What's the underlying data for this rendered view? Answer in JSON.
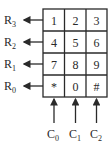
{
  "diagram": {
    "type": "keypad-matrix",
    "grid": {
      "rows": [
        [
          "1",
          "2",
          "3"
        ],
        [
          "4",
          "5",
          "6"
        ],
        [
          "7",
          "8",
          "9"
        ],
        [
          "*",
          "0",
          "#"
        ]
      ]
    },
    "row_labels": [
      {
        "base": "R",
        "sub": "3"
      },
      {
        "base": "R",
        "sub": "2"
      },
      {
        "base": "R",
        "sub": "1"
      },
      {
        "base": "R",
        "sub": "0"
      }
    ],
    "col_labels": [
      {
        "base": "C",
        "sub": "0"
      },
      {
        "base": "C",
        "sub": "1"
      },
      {
        "base": "C",
        "sub": "2"
      }
    ],
    "colors": {
      "line": "#2a2a2a",
      "background": "#ffffff"
    }
  }
}
